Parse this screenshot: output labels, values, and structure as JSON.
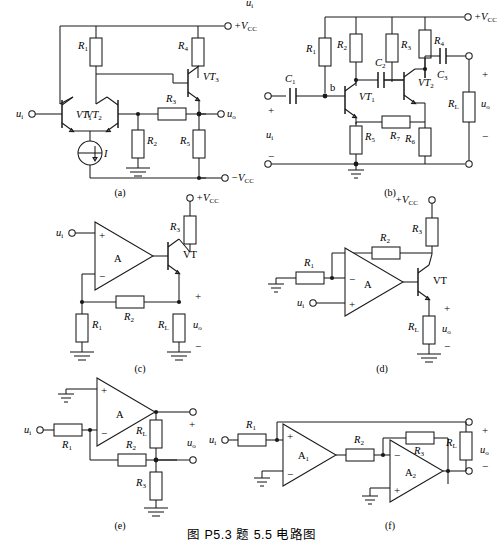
{
  "figure": {
    "caption": "图 P5.3   题 5.5 电路图",
    "top_fragment": "u",
    "top_fragment_sub": "i"
  },
  "colors": {
    "line": "#1a1a1a",
    "background": "#ffffff",
    "text": "#000000"
  },
  "subfigures": [
    {
      "id": "a",
      "label": "(a)",
      "type": "differential-amplifier",
      "nodes": [
        "+VCC",
        "-VCC"
      ],
      "signals": {
        "input": "u",
        "input_sub": "i",
        "output": "u",
        "output_sub": "o"
      },
      "transistors": [
        {
          "name": "VT",
          "sub": "1"
        },
        {
          "name": "VT",
          "sub": "2"
        },
        {
          "name": "VT",
          "sub": "3"
        }
      ],
      "resistors": [
        {
          "name": "R",
          "sub": "1"
        },
        {
          "name": "R",
          "sub": "2"
        },
        {
          "name": "R",
          "sub": "3"
        },
        {
          "name": "R",
          "sub": "4"
        },
        {
          "name": "R",
          "sub": "5"
        }
      ],
      "current_source": {
        "label": "I"
      },
      "supply_positive": "+V",
      "supply_positive_sub": "CC",
      "supply_negative": "−V",
      "supply_negative_sub": "CC"
    },
    {
      "id": "b",
      "label": "(b)",
      "type": "two-stage-rc-coupled-amplifier",
      "signals": {
        "input": "u",
        "input_sub": "i",
        "output": "u",
        "output_sub": "o"
      },
      "transistors": [
        {
          "name": "VT",
          "sub": "1"
        },
        {
          "name": "VT",
          "sub": "2"
        }
      ],
      "resistors": [
        {
          "name": "R",
          "sub": "1"
        },
        {
          "name": "R",
          "sub": "2"
        },
        {
          "name": "R",
          "sub": "3"
        },
        {
          "name": "R",
          "sub": "4"
        },
        {
          "name": "R",
          "sub": "5"
        },
        {
          "name": "R",
          "sub": "6"
        },
        {
          "name": "R",
          "sub": "7"
        },
        {
          "name": "R",
          "sub": "L"
        }
      ],
      "capacitors": [
        {
          "name": "C",
          "sub": "1"
        },
        {
          "name": "C",
          "sub": "2"
        },
        {
          "name": "C",
          "sub": "3"
        }
      ],
      "node_labels": [
        "b"
      ],
      "polarity": [
        "+",
        "−"
      ],
      "supply_positive": "+V",
      "supply_positive_sub": "CC"
    },
    {
      "id": "c",
      "label": "(c)",
      "type": "opamp-with-transistor-follower",
      "amplifier": "A",
      "signals": {
        "input": "u",
        "input_sub": "i",
        "output": "u",
        "output_sub": "o"
      },
      "transistor": {
        "name": "VT"
      },
      "resistors": [
        {
          "name": "R",
          "sub": "1"
        },
        {
          "name": "R",
          "sub": "2"
        },
        {
          "name": "R",
          "sub": "3"
        },
        {
          "name": "R",
          "sub": "L"
        }
      ],
      "opamp_terminals": [
        "+",
        "−"
      ],
      "polarity": [
        "+",
        "−"
      ],
      "supply_positive": "+V",
      "supply_positive_sub": "CC"
    },
    {
      "id": "d",
      "label": "(d)",
      "type": "opamp-with-transistor-inverting-feedback",
      "amplifier": "A",
      "signals": {
        "input": "u",
        "input_sub": "i",
        "output": "u",
        "output_sub": "o"
      },
      "transistor": {
        "name": "VT"
      },
      "resistors": [
        {
          "name": "R",
          "sub": "1"
        },
        {
          "name": "R",
          "sub": "2"
        },
        {
          "name": "R",
          "sub": "3"
        },
        {
          "name": "R",
          "sub": "L"
        }
      ],
      "opamp_terminals": [
        "−",
        "+"
      ],
      "polarity": [
        "+",
        "−"
      ],
      "supply_positive": "+V",
      "supply_positive_sub": "CC"
    },
    {
      "id": "e",
      "label": "(e)",
      "type": "inverting-opamp-with-divider-feedback",
      "amplifier": "A",
      "signals": {
        "input": "u",
        "input_sub": "i",
        "output": "u",
        "output_sub": "o"
      },
      "resistors": [
        {
          "name": "R",
          "sub": "1"
        },
        {
          "name": "R",
          "sub": "2"
        },
        {
          "name": "R",
          "sub": "3"
        },
        {
          "name": "R",
          "sub": "L"
        }
      ],
      "opamp_terminals": [
        "+",
        "−"
      ],
      "polarity": [
        "+",
        "−"
      ]
    },
    {
      "id": "f",
      "label": "(f)",
      "type": "two-stage-opamp-cascade",
      "amplifiers": [
        {
          "name": "A",
          "sub": "1"
        },
        {
          "name": "A",
          "sub": "2"
        }
      ],
      "signals": {
        "input": "u",
        "input_sub": "i",
        "output": "u",
        "output_sub": "o"
      },
      "resistors": [
        {
          "name": "R",
          "sub": "1"
        },
        {
          "name": "R",
          "sub": "2"
        },
        {
          "name": "R",
          "sub": "3"
        },
        {
          "name": "R",
          "sub": "L"
        }
      ],
      "opamp1_terminals": [
        "+",
        "−"
      ],
      "opamp2_terminals": [
        "−",
        "+"
      ],
      "polarity": [
        "+",
        "−"
      ]
    }
  ]
}
